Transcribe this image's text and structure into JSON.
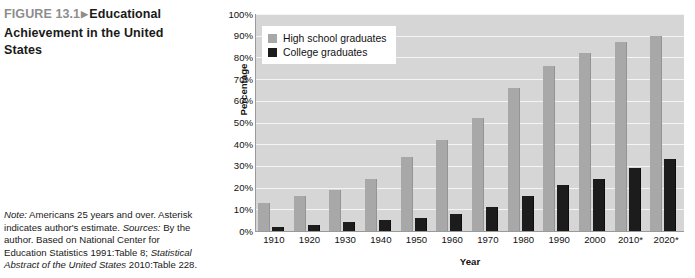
{
  "caption": {
    "figure_number": "FIGURE 13.1",
    "arrow": "▶",
    "title": "Educational Achievement in the United States",
    "note_label": "Note:",
    "note_text": " Americans 25 years and over. Asterisk indicates author's estimate.",
    "sources_label": "Sources:",
    "sources_text_1": " By the author. Based on National Center for Education Statistics 1991:Table 8; ",
    "sources_italic": "Statistical Abstract of the United States",
    "sources_text_2": " 2010:Table 228."
  },
  "chart_data": {
    "type": "bar",
    "title": "Educational Achievement in the United States",
    "xlabel": "Year",
    "ylabel": "Percentage",
    "ylim": [
      0,
      100
    ],
    "ytick_labels": [
      "100%",
      "90%",
      "80%",
      "70%",
      "60%",
      "50%",
      "40%",
      "30%",
      "20%",
      "10%",
      "0%"
    ],
    "ytick_values": [
      100,
      90,
      80,
      70,
      60,
      50,
      40,
      30,
      20,
      10,
      0
    ],
    "grid": true,
    "legend_position": "top-left",
    "categories": [
      "1910",
      "1920",
      "1930",
      "1940",
      "1950",
      "1960",
      "1970",
      "1980",
      "1990",
      "2000",
      "2010*",
      "2020*"
    ],
    "series": [
      {
        "name": "High school graduates",
        "color": "#a8a8a8",
        "values": [
          13,
          16,
          19,
          24,
          34,
          42,
          52,
          66,
          76,
          82,
          87,
          90
        ]
      },
      {
        "name": "College graduates",
        "color": "#1c1c1c",
        "values": [
          2,
          3,
          4,
          5,
          6,
          8,
          11,
          16,
          21,
          24,
          29,
          33
        ]
      }
    ]
  }
}
